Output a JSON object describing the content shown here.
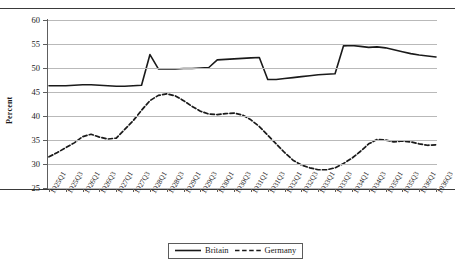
{
  "chart": {
    "ylabel": "Percent",
    "xlabel": "",
    "title": "",
    "legend_position": "bottom-center"
  },
  "legend": {
    "items": [
      {
        "label": "Britain",
        "style": "solid",
        "color": "#1a1a1a"
      },
      {
        "label": "Germany",
        "style": "dashed",
        "color": "#1a1a1a"
      }
    ]
  },
  "axes": {
    "y_ticks": [
      60,
      55,
      50,
      45,
      40,
      35,
      30,
      25
    ],
    "x_ticks": [
      "1925Q1",
      "1925Q3",
      "1926Q1",
      "1926Q3",
      "1927Q1",
      "1927Q3",
      "1928Q1",
      "1928Q3",
      "1929Q1",
      "1929Q3",
      "1930Q1",
      "1930Q3",
      "1931Q1",
      "1931Q3",
      "1932Q1",
      "1932Q3",
      "1933Q1",
      "1933Q3",
      "1934Q1",
      "1934Q3",
      "1935Q1",
      "1935Q3",
      "1936Q1",
      "1936Q3"
    ]
  },
  "chart_data": {
    "type": "line",
    "title": "",
    "xlabel": "",
    "ylabel": "Percent",
    "ylim": [
      25,
      60
    ],
    "grid": true,
    "legend_position": "bottom-center",
    "x": [
      "1925Q1",
      "1925Q2",
      "1925Q3",
      "1925Q4",
      "1926Q1",
      "1926Q2",
      "1926Q3",
      "1926Q4",
      "1927Q1",
      "1927Q2",
      "1927Q3",
      "1927Q4",
      "1928Q1",
      "1928Q2",
      "1928Q3",
      "1928Q4",
      "1929Q1",
      "1929Q2",
      "1929Q3",
      "1929Q4",
      "1930Q1",
      "1930Q2",
      "1930Q3",
      "1930Q4",
      "1931Q1",
      "1931Q2",
      "1931Q3",
      "1931Q4",
      "1932Q1",
      "1932Q2",
      "1932Q3",
      "1932Q4",
      "1933Q1",
      "1933Q2",
      "1933Q3",
      "1933Q4",
      "1934Q1",
      "1934Q2",
      "1934Q3",
      "1934Q4",
      "1935Q1",
      "1935Q2",
      "1935Q3",
      "1935Q4",
      "1936Q1",
      "1936Q2",
      "1936Q3"
    ],
    "series": [
      {
        "name": "Britain",
        "style": "solid",
        "color": "#1a1a1a",
        "values": [
          46.3,
          46.3,
          46.3,
          46.4,
          46.5,
          46.5,
          46.4,
          46.3,
          46.2,
          46.2,
          46.3,
          46.4,
          52.8,
          49.8,
          49.8,
          49.8,
          49.9,
          49.9,
          50.0,
          50.1,
          51.7,
          51.8,
          51.9,
          52.0,
          52.1,
          52.2,
          47.6,
          47.6,
          47.8,
          48.0,
          48.2,
          48.4,
          48.6,
          48.7,
          48.8,
          54.6,
          54.7,
          54.5,
          54.3,
          54.4,
          54.2,
          53.8,
          53.4,
          53.0,
          52.7,
          52.5,
          52.3
        ]
      },
      {
        "name": "Germany",
        "style": "dashed",
        "color": "#1a1a1a",
        "values": [
          31.5,
          32.4,
          33.4,
          34.4,
          35.7,
          36.2,
          35.6,
          35.2,
          35.4,
          37.2,
          39.0,
          41.2,
          43.2,
          44.3,
          44.6,
          44.2,
          43.2,
          42.0,
          41.0,
          40.4,
          40.3,
          40.5,
          40.6,
          40.2,
          39.2,
          37.8,
          36.0,
          34.2,
          32.4,
          30.8,
          29.8,
          29.2,
          28.8,
          28.8,
          29.2,
          30.1,
          31.2,
          32.6,
          34.2,
          35.1,
          35.0,
          34.6,
          34.8,
          34.6,
          34.2,
          33.9,
          34.0
        ]
      }
    ]
  }
}
